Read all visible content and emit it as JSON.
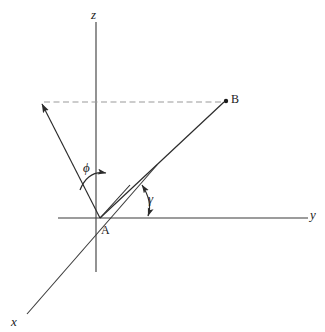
{
  "figure": {
    "title": "",
    "type": "3d-coordinate-vector-diagram",
    "background_color": "#ffffff",
    "line_color": "#2b2b2b",
    "dashed_color": "#8c8c8c"
  },
  "axes": [
    {
      "name": "z-axis",
      "label": "z",
      "label_x": 91,
      "label_y": 9,
      "x1": 96,
      "y1": 22,
      "x2": 96,
      "y2": 272
    },
    {
      "name": "y-axis",
      "label": "y",
      "label_x": 310,
      "label_y": 209,
      "x1": 58,
      "y1": 218,
      "x2": 308,
      "y2": 218
    },
    {
      "name": "x-axis",
      "label": "x",
      "label_x": 12,
      "label_y": 316,
      "x1": 155,
      "y1": 168,
      "x2": 27,
      "y2": 314
    }
  ],
  "points": [
    {
      "name": "origin",
      "label": "A",
      "label_x": 101,
      "label_y": 225,
      "x": 100,
      "y": 218,
      "dot": false
    },
    {
      "name": "vector-tip",
      "label": "B",
      "label_x": 231,
      "label_y": 93,
      "x": 226,
      "y": 101,
      "dot": true
    }
  ],
  "segments": [
    {
      "name": "vector-AB",
      "x1": 100,
      "y1": 218,
      "x2": 226,
      "y2": 101,
      "style": "solid"
    },
    {
      "name": "projection-arrow",
      "x1": 100,
      "y1": 218,
      "x2": 40,
      "y2": 104,
      "style": "solid",
      "arrow": "end"
    },
    {
      "name": "dashed-horizontal",
      "x1": 42,
      "y1": 102,
      "x2": 226,
      "y2": 102,
      "style": "dashed"
    },
    {
      "name": "short-projection-tick",
      "x1": 100,
      "y1": 218,
      "x2": 129,
      "y2": 186,
      "style": "solid"
    }
  ],
  "angles": [
    {
      "name": "angle-phi",
      "label": "ϕ",
      "label_x": 83,
      "label_y": 161,
      "arrow": "end",
      "arc": "M 80 189 Q 90 171 106 174"
    },
    {
      "name": "angle-gamma",
      "label": "γ",
      "label_x": 148,
      "label_y": 192,
      "arrow": "both",
      "arc": "M 141 184 Q 152 203 148 217"
    }
  ]
}
